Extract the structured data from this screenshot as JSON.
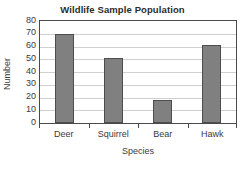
{
  "chart_data": {
    "type": "bar",
    "title": "Wildlife Sample Population",
    "xlabel": "Species",
    "ylabel": "Number",
    "categories": [
      "Deer",
      "Squirrel",
      "Bear",
      "Hawk"
    ],
    "values": [
      70,
      51,
      18,
      61
    ],
    "ylim": [
      0,
      80
    ],
    "ytick_labels": [
      "80",
      "70",
      "60",
      "50",
      "40",
      "30",
      "20",
      "10",
      "0"
    ],
    "ytick_values": [
      80,
      70,
      60,
      50,
      40,
      30,
      20,
      10,
      0
    ],
    "ytick_step": 10,
    "grid": "horizontal",
    "legend": "none",
    "bar_color": "#808080",
    "bar_edge_color": "#4d4d4d",
    "grid_color": "#cfcfcf",
    "frame_color": "#4a4a4a",
    "background_color": "#ffffff",
    "text_color": "#3a3a3a"
  }
}
